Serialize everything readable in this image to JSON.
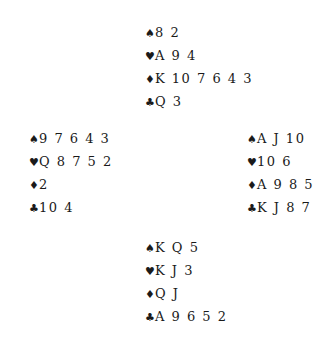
{
  "symbols": {
    "spades": "♠",
    "hearts": "♥",
    "diamonds": "♦",
    "clubs": "♣"
  },
  "hands": {
    "north": {
      "spades": "8 2",
      "hearts": "A 9 4",
      "diamonds": "K 10 7 6 4 3",
      "clubs": "Q 3"
    },
    "west": {
      "spades": "9 7 6 4 3",
      "hearts": "Q 8 7 5 2",
      "diamonds": "2",
      "clubs": "10 4"
    },
    "east": {
      "spades": "A J 10",
      "hearts": "10 6",
      "diamonds": "A 9 8 5",
      "clubs": "K J 8 7"
    },
    "south": {
      "spades": "K Q 5",
      "hearts": "K J 3",
      "diamonds": "Q J",
      "clubs": "A 9 6 5 2"
    }
  }
}
